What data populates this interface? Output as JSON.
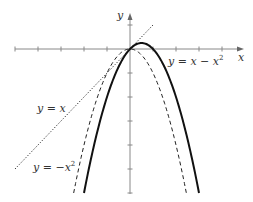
{
  "diagram": {
    "type": "function-graph",
    "axes": {
      "x_label": "x",
      "y_label": "y",
      "x_ticks": [
        -5,
        -4,
        -3,
        -2,
        -1,
        1,
        2,
        3,
        4
      ],
      "y_ticks": [
        1,
        -1,
        -2,
        -3,
        -4,
        -5,
        -6
      ],
      "x_range": [
        -5,
        4.9
      ],
      "y_range": [
        -6,
        1.5
      ]
    },
    "curves": [
      {
        "name": "y = x - x^2",
        "style": "solid",
        "label_main": "y = x − x",
        "label_sup": "2"
      },
      {
        "name": "y = -x^2",
        "style": "dashed",
        "label_main": "y = −x",
        "label_sup": "2"
      },
      {
        "name": "y = x",
        "style": "dotted",
        "label_main": "y = x",
        "label_sup": ""
      }
    ],
    "colors": {
      "axis": "#777777",
      "curve": "#111111",
      "text": "#333333"
    }
  }
}
